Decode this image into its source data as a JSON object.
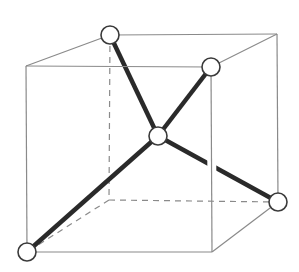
{
  "diagram": {
    "type": "3d-cube-with-tetrahedral-bonds",
    "colors": {
      "background": "#ffffff",
      "cube_edge": "#8a8a8a",
      "bond": "#2a2a2a",
      "atom_fill": "#ffffff",
      "atom_stroke": "#3a3a3a"
    },
    "cube_vertices": {
      "front_top_left": [
        26,
        66
      ],
      "front_top_right": [
        211,
        67
      ],
      "front_bottom_left": [
        27,
        252
      ],
      "front_bottom_right": [
        212,
        252
      ],
      "back_top_left": [
        110,
        35
      ],
      "back_top_right": [
        277,
        34
      ],
      "back_bottom_left": [
        109,
        200
      ],
      "back_bottom_right": [
        278,
        202
      ]
    },
    "visible_edges": [
      [
        "front_top_left",
        "front_top_right"
      ],
      [
        "front_top_left",
        "front_bottom_left"
      ],
      [
        "front_bottom_left",
        "front_bottom_right"
      ],
      [
        "front_top_right",
        "front_bottom_right"
      ],
      [
        "back_top_left",
        "back_top_right"
      ],
      [
        "back_top_right",
        "back_bottom_right"
      ],
      [
        "front_top_left",
        "back_top_left"
      ],
      [
        "front_top_right",
        "back_top_right"
      ],
      [
        "front_bottom_right",
        "back_bottom_right"
      ]
    ],
    "hidden_edges": [
      [
        "back_top_left",
        "back_bottom_left"
      ],
      [
        "back_bottom_left",
        "back_bottom_right"
      ],
      [
        "back_bottom_left",
        "front_bottom_left"
      ]
    ],
    "atoms": [
      {
        "id": "center",
        "position": [
          158,
          136
        ],
        "radius": 9
      },
      {
        "id": "back_top_left",
        "position": [
          110,
          35
        ],
        "radius": 9
      },
      {
        "id": "front_top_right",
        "position": [
          211,
          67
        ],
        "radius": 9
      },
      {
        "id": "back_bottom_right",
        "position": [
          278,
          202
        ],
        "radius": 9
      },
      {
        "id": "front_bottom_left",
        "position": [
          27,
          252
        ],
        "radius": 9
      }
    ],
    "bonds": [
      [
        "center",
        "back_top_left"
      ],
      [
        "center",
        "front_top_right"
      ],
      [
        "center",
        "back_bottom_right"
      ],
      [
        "center",
        "front_bottom_left"
      ]
    ]
  }
}
